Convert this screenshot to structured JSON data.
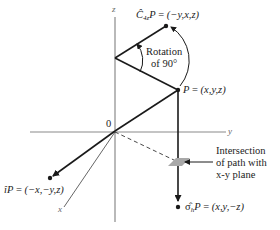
{
  "figure": {
    "axes": {
      "z_label": "z",
      "y_label": "y",
      "x_label": "x",
      "origin_label": "0"
    },
    "points": {
      "p": {
        "label_lhs": "P",
        "label_rhs": "(x,y,z)"
      },
      "c4": {
        "operator": "Ĉ",
        "subscript": "4z",
        "label_lhs": "P",
        "label_rhs": "(−y,x,z)"
      },
      "inversion": {
        "operator": "î",
        "label_lhs": "P",
        "label_rhs": "(−x,−y,z)"
      },
      "reflection": {
        "operator": "σ̂",
        "subscript": "h",
        "label_lhs": "P",
        "label_rhs": "(x,y,−z)"
      }
    },
    "annotations": {
      "rotation_line1": "Rotation",
      "rotation_line2": "of 90°",
      "intersection_line1": "Intersection",
      "intersection_line2": "of path with",
      "intersection_line3": "x-y plane"
    },
    "colors": {
      "axis": "#8a8a8a",
      "path": "#1a1a1a",
      "patch": "#a8a8a8"
    }
  }
}
